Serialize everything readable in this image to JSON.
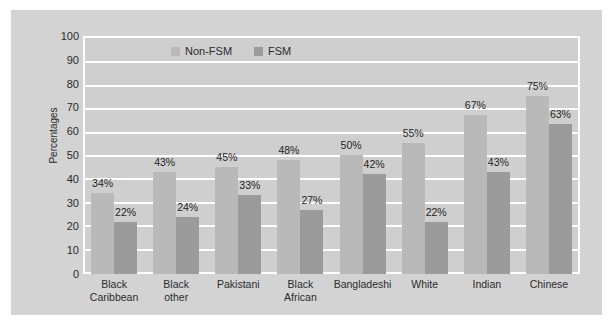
{
  "chart_data": {
    "type": "bar",
    "title": "",
    "xlabel": "",
    "ylabel": "Percentages",
    "ylim": [
      0,
      100
    ],
    "ytick_step": 10,
    "yticks": [
      100,
      90,
      80,
      70,
      60,
      50,
      40,
      30,
      20,
      10,
      0
    ],
    "grid": true,
    "legend_position": "top-center",
    "categories": [
      "Black\nCaribbean",
      "Black\nother",
      "Pakistani",
      "Black\nAfrican",
      "Bangladeshi",
      "White",
      "Indian",
      "Chinese"
    ],
    "series": [
      {
        "name": "Non-FSM",
        "color": "#b9b9b9",
        "values": [
          34,
          43,
          45,
          48,
          50,
          55,
          67,
          75
        ],
        "labels": [
          "34%",
          "43%",
          "45%",
          "48%",
          "50%",
          "55%",
          "67%",
          "75%"
        ]
      },
      {
        "name": "FSM",
        "color": "#9b9b9b",
        "values": [
          22,
          24,
          33,
          27,
          42,
          22,
          43,
          63
        ],
        "labels": [
          "22%",
          "24%",
          "33%",
          "27%",
          "42%",
          "22%",
          "43%",
          "63%"
        ]
      }
    ]
  },
  "colors": {
    "page_background": "#ffffff",
    "chart_background": "#d3d3d3",
    "plot_background": "#cfcfcf",
    "gridline": "#ffffff",
    "axis_line": "#ffffff",
    "text": "#2b2b2b",
    "series_non_fsm": "#b9b9b9",
    "series_fsm": "#9b9b9b"
  }
}
